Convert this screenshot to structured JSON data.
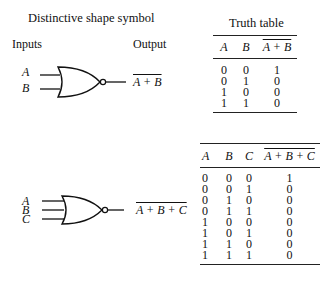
{
  "section1": {
    "title": "Distinctive shape symbol",
    "inputs_label": "Inputs",
    "output_label": "Output",
    "inputs": [
      "A",
      "B"
    ],
    "output_expr": "A + B"
  },
  "truth_table_2": {
    "title": "Truth table",
    "headers": [
      "A",
      "B",
      "A + B"
    ],
    "rows": [
      [
        "0",
        "0",
        "1"
      ],
      [
        "0",
        "1",
        "0"
      ],
      [
        "1",
        "0",
        "0"
      ],
      [
        "1",
        "1",
        "0"
      ]
    ]
  },
  "section2": {
    "inputs": [
      "A",
      "B",
      "C"
    ],
    "output_expr": "A + B + C"
  },
  "truth_table_3": {
    "headers": [
      "A",
      "B",
      "C",
      "A + B + C"
    ],
    "rows": [
      [
        "0",
        "0",
        "0",
        "1"
      ],
      [
        "0",
        "0",
        "1",
        "0"
      ],
      [
        "0",
        "1",
        "0",
        "0"
      ],
      [
        "0",
        "1",
        "1",
        "0"
      ],
      [
        "1",
        "0",
        "0",
        "0"
      ],
      [
        "1",
        "0",
        "1",
        "0"
      ],
      [
        "1",
        "1",
        "0",
        "0"
      ],
      [
        "1",
        "1",
        "1",
        "0"
      ]
    ]
  }
}
